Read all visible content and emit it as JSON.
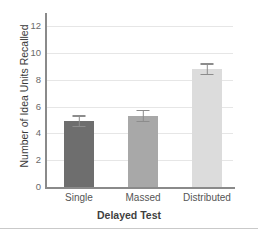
{
  "chart_data": {
    "type": "bar",
    "title": "",
    "xlabel": "Delayed Test",
    "ylabel": "Number of Idea Units Recalled",
    "categories": [
      "Single",
      "Massed",
      "Distributed"
    ],
    "values": [
      4.9,
      5.3,
      8.8
    ],
    "errors": [
      0.45,
      0.45,
      0.45
    ],
    "bar_colors": [
      "#6e6e6e",
      "#a8a8a8",
      "#dcdcdc"
    ],
    "error_bar_color": "#8c8c8c",
    "ylim": [
      0,
      13
    ],
    "ytick_labels": [
      "0",
      "2",
      "4",
      "6",
      "8",
      "10",
      "12"
    ],
    "ytick_values": [
      0,
      2,
      4,
      6,
      8,
      10,
      12
    ],
    "grid": true,
    "grid_color": "#e6e6e6",
    "axis_color": "#8a8a8a",
    "legend": null,
    "legend_position": "none"
  }
}
